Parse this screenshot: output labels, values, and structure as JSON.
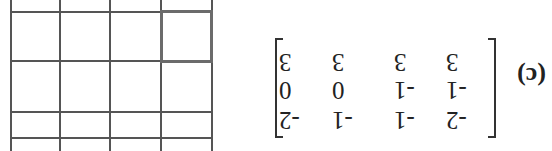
{
  "figure": {
    "rotation_deg": 180,
    "label": "(c)",
    "matrix": {
      "rows": [
        [
          "-2",
          "-1",
          "-1",
          "-2"
        ],
        [
          "-1",
          "-1",
          "0",
          "0"
        ],
        [
          "3",
          "3",
          "3",
          "3"
        ]
      ]
    },
    "grid": {
      "columns": 4,
      "visible_rows": 4,
      "highlighted_cell": {
        "row_from_bottom_in_view": 1,
        "col": 1
      },
      "line_color": "#555555",
      "highlight_color": "#6b6b6b"
    }
  }
}
